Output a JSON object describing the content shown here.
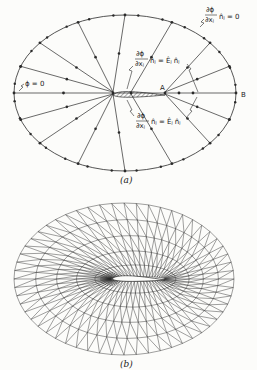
{
  "figure": {
    "panel_a": {
      "caption": "(a)",
      "ellipse": {
        "cx": 125,
        "cy": 93,
        "rx": 111,
        "ry": 78
      },
      "airfoil": {
        "le": [
          113,
          95
        ],
        "te": [
          165,
          95
        ]
      },
      "point_labels": {
        "A": "A",
        "B": "B"
      },
      "annotations": {
        "outer_bc": {
          "num": "∂ϕ",
          "den": "∂xⱼ",
          "rhs": "n̂ⱼ = 0"
        },
        "left_bc": "ϕ = 0",
        "upper_surface_bc": {
          "num": "∂ϕ",
          "den": "∂xⱼ",
          "rhs": "n̂ⱼ = Êⱼ n̂ⱼ"
        },
        "lower_surface_bc": {
          "num": "∂ϕ",
          "den": "∂xⱼ",
          "rhs": "n̂ⱼ = Êⱼ n̂ⱼ"
        }
      },
      "radial_lines": 16
    },
    "panel_b": {
      "caption": "(b)",
      "ellipse": {
        "cx": 124,
        "cy": 279,
        "rx": 110,
        "ry": 76
      },
      "airfoil": {
        "le": [
          110,
          279
        ],
        "te": [
          165,
          280
        ]
      },
      "rings": 5,
      "spokes": 56
    },
    "colors": {
      "line": "#2a2a2a",
      "background": "#fcfcfa"
    }
  }
}
